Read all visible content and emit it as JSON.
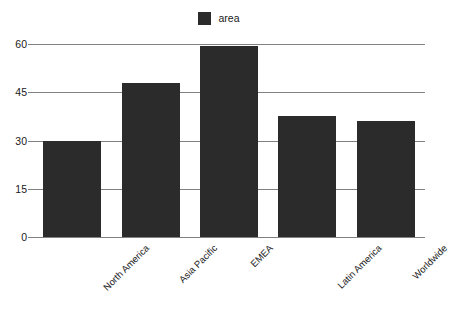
{
  "chart_data": {
    "type": "bar",
    "title": "",
    "subtitle": "",
    "xlabel": "",
    "ylabel": "",
    "categories": [
      "North America",
      "Asia Pacific",
      "EMEA",
      "Latin America",
      "Worldwide"
    ],
    "series": [
      {
        "name": "area",
        "values": [
          30,
          48,
          59.5,
          37.5,
          36
        ],
        "color": "#2b2b2b"
      }
    ],
    "values": [
      30,
      48,
      59.5,
      37.5,
      36
    ],
    "ylim": [
      0,
      60
    ],
    "yticks": [
      0,
      15,
      30,
      45,
      60
    ],
    "ytick_labels": [
      "0",
      "15",
      "30",
      "45",
      "60"
    ],
    "grid": true,
    "grid_axis": "y",
    "grid_color": "#808080",
    "legend": {
      "position": "top-center",
      "entries": [
        {
          "label": "area",
          "color": "#2b2b2b",
          "swatch": "square-swatch-icon"
        }
      ]
    },
    "xtick_rotation": -45,
    "background": "#ffffff",
    "text_color": "#1a1a1a"
  }
}
